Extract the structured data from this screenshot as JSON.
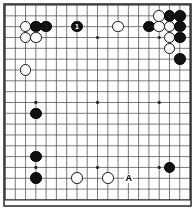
{
  "figure": {
    "kind": "go-board-diagram",
    "board_size": 19,
    "colors": {
      "background": "#ffffff",
      "grid_line": "#555555",
      "grid_line_strong": "#222222",
      "border": "#333333",
      "black_stone": "#111111",
      "white_stone": "#ffffff",
      "star_point": "#222222",
      "label_text": "#000000"
    },
    "geometry": {
      "width": 195,
      "height": 213,
      "origin_x": 5.0,
      "origin_y": 5.0,
      "spacing_x": 10.28,
      "spacing_y": 10.83,
      "stone_diameter": 11.6,
      "star_point_radius": 1.6,
      "frame_left": 4,
      "frame_top": 4,
      "frame_right": 191,
      "frame_bottom": 206
    },
    "star_points": [
      {
        "col": 3,
        "row": 3
      },
      {
        "col": 9,
        "row": 3
      },
      {
        "col": 15,
        "row": 3
      },
      {
        "col": 3,
        "row": 9
      },
      {
        "col": 9,
        "row": 9
      },
      {
        "col": 15,
        "row": 9
      },
      {
        "col": 3,
        "row": 15
      },
      {
        "col": 9,
        "row": 15
      },
      {
        "col": 15,
        "row": 15
      }
    ],
    "stones": [
      {
        "col": 2,
        "row": 2,
        "color": "white"
      },
      {
        "col": 3,
        "row": 2,
        "color": "black"
      },
      {
        "col": 4,
        "row": 2,
        "color": "black"
      },
      {
        "col": 2,
        "row": 3,
        "color": "white"
      },
      {
        "col": 3,
        "row": 3,
        "color": "white"
      },
      {
        "col": 7,
        "row": 2,
        "color": "black",
        "label": "1",
        "label_color": "on-black"
      },
      {
        "col": 11,
        "row": 2,
        "color": "white"
      },
      {
        "col": 14,
        "row": 2,
        "color": "black"
      },
      {
        "col": 15,
        "row": 1,
        "color": "white"
      },
      {
        "col": 16,
        "row": 1,
        "color": "black"
      },
      {
        "col": 17,
        "row": 1,
        "color": "black"
      },
      {
        "col": 15,
        "row": 2,
        "color": "white"
      },
      {
        "col": 16,
        "row": 2,
        "color": "white"
      },
      {
        "col": 17,
        "row": 2,
        "color": "black"
      },
      {
        "col": 16,
        "row": 3,
        "color": "white"
      },
      {
        "col": 17,
        "row": 3,
        "color": "black"
      },
      {
        "col": 16,
        "row": 4,
        "color": "white"
      },
      {
        "col": 17,
        "row": 5,
        "color": "black"
      },
      {
        "col": 2,
        "row": 6,
        "color": "white"
      },
      {
        "col": 3,
        "row": 10,
        "color": "black"
      },
      {
        "col": 3,
        "row": 14,
        "color": "black"
      },
      {
        "col": 3,
        "row": 16,
        "color": "black"
      },
      {
        "col": 7,
        "row": 16,
        "color": "white"
      },
      {
        "col": 10,
        "row": 16,
        "color": "white"
      },
      {
        "col": 16,
        "row": 15,
        "color": "black"
      }
    ],
    "point_labels": [
      {
        "col": 12,
        "row": 16,
        "text": "A"
      }
    ]
  }
}
